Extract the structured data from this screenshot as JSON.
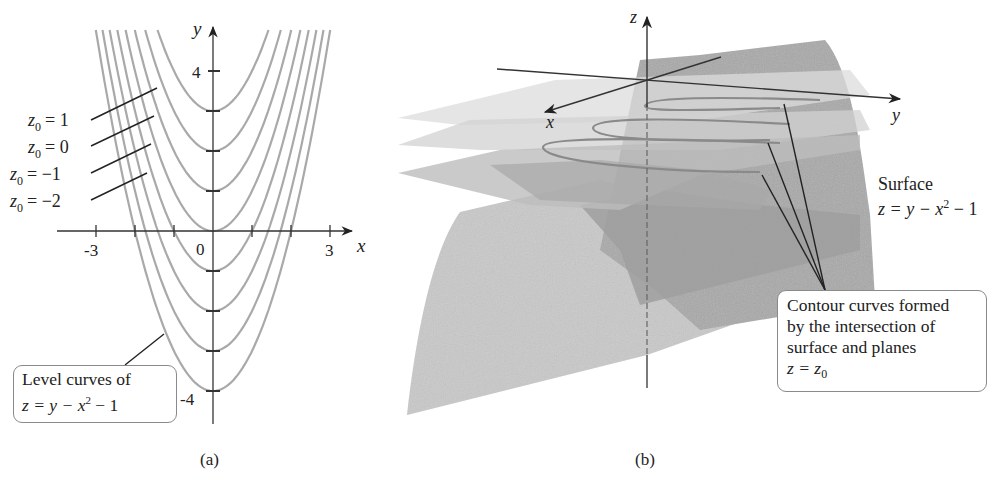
{
  "panel_a": {
    "caption": "(a)",
    "axis_x_label": "x",
    "axis_y_label": "y",
    "x_ticks": [
      -3,
      -2,
      -1,
      0,
      1,
      2,
      3
    ],
    "x_tick_labels": [
      "-3",
      "0",
      "3"
    ],
    "y_ticks": [
      4,
      3,
      2,
      1,
      0,
      -1,
      -2,
      -3,
      -4
    ],
    "y_tick_labels": [
      "4",
      "-4"
    ],
    "level_labels": [
      "z0 = 1",
      "z0 = 0",
      "z0 = −1",
      "z0 = −2"
    ],
    "level_label_parts": [
      {
        "var": "z",
        "sub": "0",
        "eq": "= 1"
      },
      {
        "var": "z",
        "sub": "0",
        "eq": "= 0"
      },
      {
        "var": "z",
        "sub": "0",
        "eq": "= −1"
      },
      {
        "var": "z",
        "sub": "0",
        "eq": "= −2"
      }
    ],
    "callout": {
      "line1": "Level curves of",
      "line2_prefix": "z = y − x",
      "line2_sup": "2",
      "line2_suffix": " − 1"
    }
  },
  "panel_b": {
    "caption": "(b)",
    "axis_x_label": "x",
    "axis_y_label": "y",
    "axis_z_label": "z",
    "surface_label": {
      "line1": "Surface",
      "line2_prefix": "z = y − x",
      "line2_sup": "2",
      "line2_suffix": " − 1"
    },
    "callout": {
      "line1": "Contour curves formed",
      "line2": "by the intersection of",
      "line3": "surface and planes",
      "line4_prefix": "z = z",
      "line4_sub": "0"
    }
  },
  "chart_data": {
    "type": "line",
    "xlabel": "x",
    "ylabel": "y",
    "xlim": [
      -3,
      3
    ],
    "ylim": [
      -4,
      5
    ],
    "grid": false,
    "series": [
      {
        "name": "z0 = 2",
        "equation": "y = x^2 + 3",
        "vertex_y": 3
      },
      {
        "name": "z0 = 1",
        "equation": "y = x^2 + 2",
        "vertex_y": 2
      },
      {
        "name": "z0 = 0",
        "equation": "y = x^2 + 1",
        "vertex_y": 1
      },
      {
        "name": "z0 = -1",
        "equation": "y = x^2",
        "vertex_y": 0
      },
      {
        "name": "z0 = -2",
        "equation": "y = x^2 - 1",
        "vertex_y": -1
      },
      {
        "name": "z0 = -3",
        "equation": "y = x^2 - 2",
        "vertex_y": -2
      },
      {
        "name": "z0 = -4",
        "equation": "y = x^2 - 3",
        "vertex_y": -3
      },
      {
        "name": "z0 = -5",
        "equation": "y = x^2 - 4",
        "vertex_y": -4
      }
    ],
    "vertex_values": [
      3,
      2,
      1,
      0,
      -1,
      -2,
      -3,
      -4
    ],
    "annotations": [
      "z0 = 1",
      "z0 = 0",
      "z0 = −1",
      "z0 = −2",
      "Level curves of z = y − x^2 − 1"
    ]
  }
}
